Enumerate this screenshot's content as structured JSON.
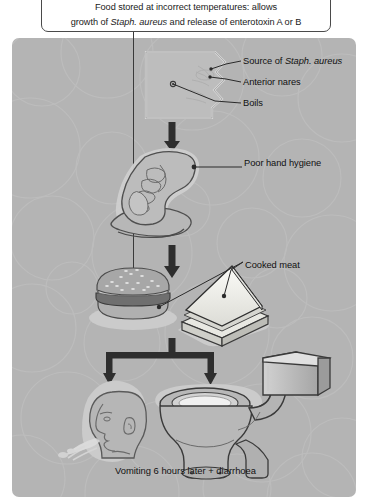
{
  "figure": {
    "caption_line1": "Food stored at incorrect temperatures: allows",
    "caption_line2_a": "growth of ",
    "caption_line2_italic": "Staph. aureus",
    "caption_line2_b": " and release of enterotoxin A or B",
    "bottom_text": "Vomiting 6 hours later +  diarrhoea"
  },
  "labels": {
    "source_prefix": "Source of ",
    "source_italic": "Staph. aureus",
    "anterior_nares": "Anterior nares",
    "boils": "Boils",
    "poor_hand_hygiene": "Poor hand hygiene",
    "cooked_meat": "Cooked meat"
  },
  "illustrations": {
    "head_photo": "head-anterior-nares-photo",
    "hand": "hand-illustration",
    "burger": "burger-illustration",
    "sandwich": "sandwich-illustration",
    "vomiting_head": "vomiting-head-illustration",
    "toilet": "toilet-illustration",
    "cistern": "cistern-illustration"
  },
  "colors": {
    "panel_background": "#b4b4b4",
    "caption_background": "#ffffff",
    "caption_border": "#4a4a4a",
    "arrow": "#2e2e2e",
    "line": "#3a3a3a",
    "text": "#111111",
    "illustration_fill": "#b9b9b9",
    "illustration_light": "#d8d8d8",
    "illustration_white": "#f4f4f2",
    "illustration_dark": "#8e8e8e",
    "illustration_stroke": "#5e5e5e",
    "halo": "#cfcfcf"
  }
}
